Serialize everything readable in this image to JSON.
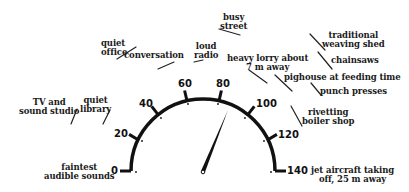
{
  "gauge": {
    "unit": "dB",
    "min": 0,
    "max": 140,
    "ticks": [
      "0",
      "20",
      "40",
      "60",
      "80",
      "100",
      "120",
      "140"
    ],
    "needle_value": 75
  },
  "sounds": [
    {
      "label": "faintest audible sounds",
      "lines": [
        "faintest",
        "audible sounds"
      ],
      "level": 0
    },
    {
      "label": "TV and sound studio",
      "lines": [
        "TV and",
        "sound studio"
      ],
      "level": 20
    },
    {
      "label": "quiet library",
      "lines": [
        "quiet",
        "library"
      ],
      "level": 30
    },
    {
      "label": "quiet office",
      "lines": [
        "quiet",
        "office"
      ],
      "level": 40
    },
    {
      "label": "conversation",
      "lines": [
        "conversation"
      ],
      "level": 50
    },
    {
      "label": "loud radio",
      "lines": [
        "loud",
        "radio"
      ],
      "level": 65
    },
    {
      "label": "busy street",
      "lines": [
        "busy",
        "street"
      ],
      "level": 75
    },
    {
      "label": "heavy lorry about 7 m away",
      "lines": [
        "heavy lorry about",
        "7 m away"
      ],
      "level": 90
    },
    {
      "label": "traditional weaving shed",
      "lines": [
        "traditional",
        "weaving shed"
      ],
      "level": 100
    },
    {
      "label": "chainsaws",
      "lines": [
        "chainsaws"
      ],
      "level": 100
    },
    {
      "label": "pighouse at feeding time",
      "lines": [
        "pighouse at feeding time"
      ],
      "level": 105
    },
    {
      "label": "punch presses",
      "lines": [
        "punch presses"
      ],
      "level": 110
    },
    {
      "label": "rivetting boiler shop",
      "lines": [
        "rivetting",
        "boiler shop"
      ],
      "level": 115
    },
    {
      "label": "jet aircraft taking off, 25 m away",
      "lines": [
        "jet aircraft taking",
        "off, 25 m away"
      ],
      "level": 140
    }
  ]
}
